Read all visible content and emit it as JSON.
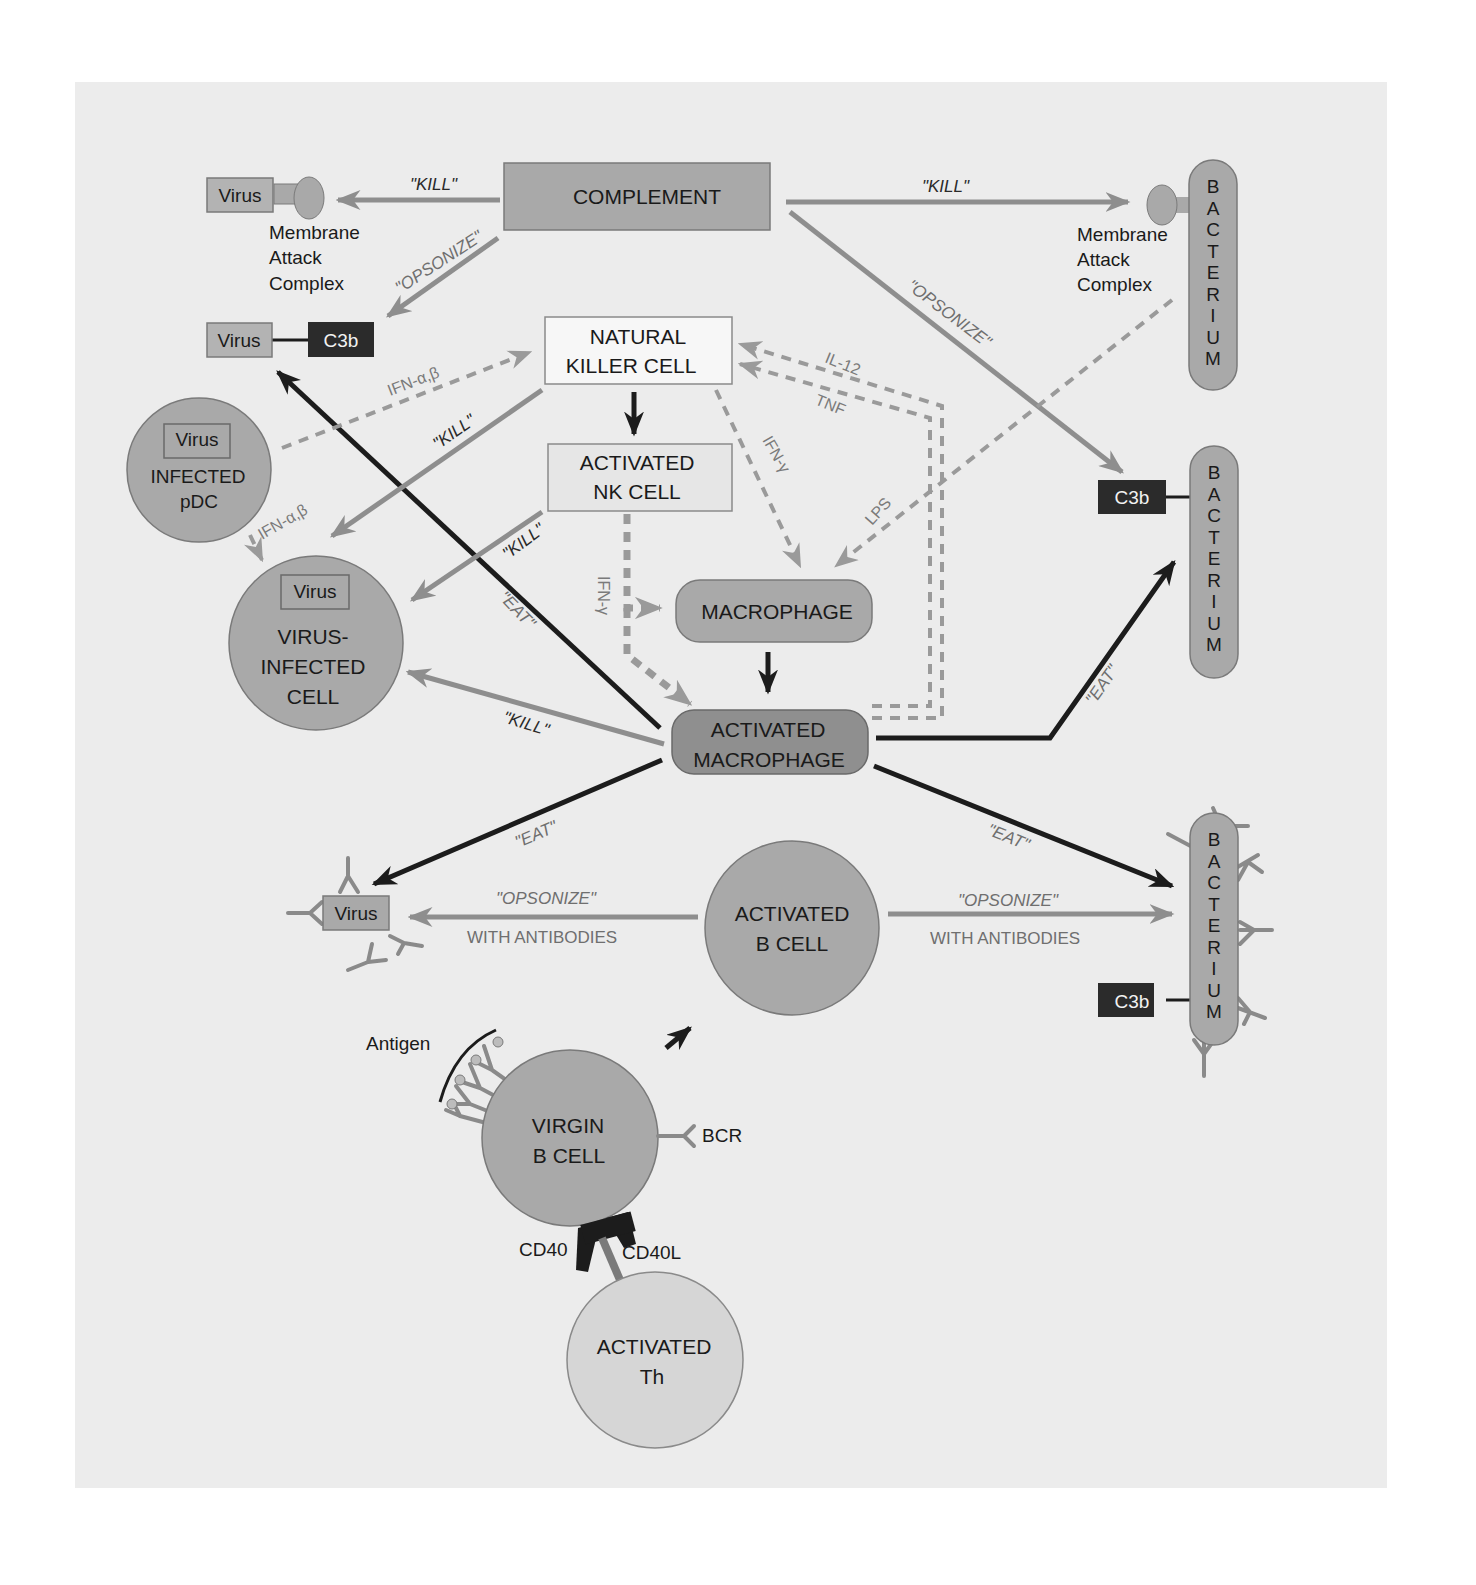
{
  "diagram": {
    "nodes": {
      "complement": "COMPLEMENT",
      "natural_killer_cell": [
        "NATURAL",
        "KILLER CELL"
      ],
      "activated_nk_cell": [
        "ACTIVATED",
        "NK CELL"
      ],
      "macrophage": "MACROPHAGE",
      "activated_macrophage": [
        "ACTIVATED",
        "MACROPHAGE"
      ],
      "infected_pdc": {
        "inner": "Virus",
        "label": [
          "INFECTED",
          "pDC"
        ]
      },
      "virus_infected_cell": {
        "inner": "Virus",
        "label": [
          "VIRUS-",
          "INFECTED",
          "CELL"
        ]
      },
      "activated_b_cell": [
        "ACTIVATED",
        "B CELL"
      ],
      "virgin_b_cell": [
        "VIRGIN",
        "B CELL"
      ],
      "activated_th": [
        "ACTIVATED",
        "Th"
      ],
      "bacterium_letters": [
        "B",
        "A",
        "C",
        "T",
        "E",
        "R",
        "I",
        "U",
        "M"
      ]
    },
    "targets": {
      "virus": "Virus",
      "c3b": "C3b",
      "membrane_attack_complex": [
        "Membrane",
        "Attack",
        "Complex"
      ]
    },
    "labels": {
      "kill": "\"KILL\"",
      "opsonize": "\"OPSONIZE\"",
      "eat": "\"EAT\"",
      "with_antibodies": "WITH ANTIBODIES",
      "ifn_ab": "IFN-α,β",
      "ifn_g": "IFN-γ",
      "il12": "IL-12",
      "tnf": "TNF",
      "lps": "LPS",
      "antigen": "Antigen",
      "bcr": "BCR",
      "cd40": "CD40",
      "cd40l": "CD40L"
    },
    "colors": {
      "panel": "#ececec",
      "node_gray": "#a9a9a9",
      "node_dark_gray": "#8f8f8f",
      "node_light": "#f7f7f7",
      "c3b_box": "#2b2b2b",
      "gray_arrow": "#8e8e8e",
      "dark_arrow": "#1c1c1c",
      "th_cell": "#d6d6d6"
    }
  }
}
